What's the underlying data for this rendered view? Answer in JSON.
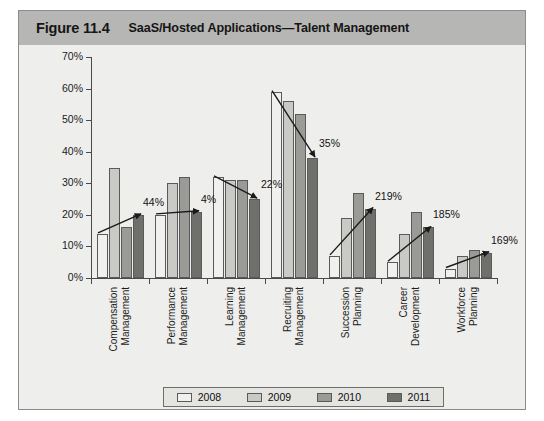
{
  "figure": {
    "number": "Figure 11.4",
    "title": "SaaS/Hosted Applications—Talent Management"
  },
  "legend": {
    "position": "bottom",
    "items": [
      {
        "label": "2008",
        "color": "#f0f0ee"
      },
      {
        "label": "2009",
        "color": "#c9c9c5"
      },
      {
        "label": "2010",
        "color": "#9a9a96"
      },
      {
        "label": "2011",
        "color": "#6f6f6c"
      }
    ]
  },
  "yaxis": {
    "ticks": [
      "0%",
      "10%",
      "20%",
      "30%",
      "40%",
      "50%",
      "60%",
      "70%"
    ]
  },
  "chart_data": {
    "type": "bar",
    "title": "SaaS/Hosted Applications—Talent Management",
    "xlabel": "",
    "ylabel": "",
    "ylim": [
      0,
      70
    ],
    "ytick_step": 10,
    "grid": false,
    "legend_position": "bottom",
    "categories": [
      "Compensation Management",
      "Performance Management",
      "Learning Management",
      "Recruiting Management",
      "Succession Planning",
      "Career Development",
      "Workforce Planning"
    ],
    "category_lines": [
      [
        "Compensation",
        "Management"
      ],
      [
        "Performance",
        "Management"
      ],
      [
        "Learning",
        "Management"
      ],
      [
        "Recruiting",
        "Management"
      ],
      [
        "Succession",
        "Planning"
      ],
      [
        "Career",
        "Development"
      ],
      [
        "Workforce",
        "Planning"
      ]
    ],
    "series": [
      {
        "name": "2008",
        "color": "#f0f0ee",
        "values": [
          14,
          20,
          32,
          59,
          7,
          5,
          3
        ]
      },
      {
        "name": "2009",
        "color": "#c9c9c5",
        "values": [
          35,
          30,
          31,
          56,
          19,
          14,
          7
        ]
      },
      {
        "name": "2010",
        "color": "#9a9a96",
        "values": [
          16,
          32,
          31,
          52,
          27,
          21,
          9
        ]
      },
      {
        "name": "2011",
        "color": "#6f6f6c",
        "values": [
          20,
          21,
          25,
          38,
          22,
          16,
          8
        ]
      }
    ],
    "annotations": [
      {
        "label": "44%",
        "category": "Compensation Management",
        "direction": "up"
      },
      {
        "label": "4%",
        "category": "Performance Management",
        "direction": "up"
      },
      {
        "label": "22%",
        "category": "Learning Management",
        "direction": "down"
      },
      {
        "label": "35%",
        "category": "Recruiting Management",
        "direction": "down"
      },
      {
        "label": "219%",
        "category": "Succession Planning",
        "direction": "up"
      },
      {
        "label": "185%",
        "category": "Career Development",
        "direction": "up"
      },
      {
        "label": "169%",
        "category": "Workforce Planning",
        "direction": "up"
      }
    ]
  }
}
